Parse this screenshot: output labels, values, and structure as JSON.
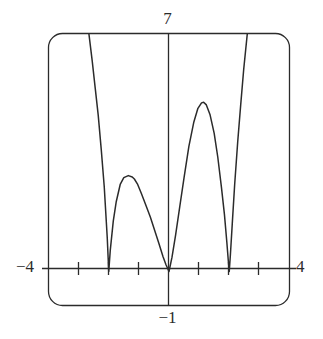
{
  "figure": {
    "kind": "graphing-calculator-window",
    "background_color": "#ffffff",
    "stroke_color": "#2b2b2b"
  },
  "labels": {
    "y_max": "7",
    "y_min": "−1",
    "x_min": "−4",
    "x_max": "4"
  },
  "chart_data": {
    "type": "line",
    "title": "",
    "xlabel": "",
    "ylabel": "",
    "xlim": [
      -4,
      4
    ],
    "ylim": [
      -1,
      7
    ],
    "grid": false,
    "legend": null,
    "x_ticks": [
      -3,
      -2,
      -1,
      0,
      1,
      2,
      3
    ],
    "x_tick_labels": [
      "",
      "",
      "",
      "",
      "",
      "",
      ""
    ],
    "y_ticks": [],
    "y_tick_labels": [],
    "axis_visible": {
      "x_axis": true,
      "y_axis": true
    },
    "x_axis_y_value": 0,
    "y_axis_x_value": 0,
    "annotations": [
      {
        "text": "7",
        "position": "above top frame, on y-axis",
        "meaning": "y window maximum"
      },
      {
        "text": "−1",
        "position": "below bottom frame, on y-axis",
        "meaning": "y window minimum"
      },
      {
        "text": "−4",
        "position": "left of frame, on x-axis",
        "meaning": "x window minimum"
      },
      {
        "text": "4",
        "position": "right of frame, on x-axis",
        "meaning": "x window maximum"
      }
    ],
    "features": {
      "zeros": [
        -2,
        0,
        2
      ],
      "zero_kind": "touches axis (cusp / V-shaped, non-negative function)",
      "local_maxima": [
        {
          "x": -1.15,
          "y": 2.82
        },
        {
          "x": 1.15,
          "y": 4.98
        }
      ],
      "off_screen_branches": [
        {
          "side": "left",
          "enters_top_at_x": -2.65
        },
        {
          "side": "right",
          "enters_top_at_x": 2.6
        }
      ],
      "description": "Non-negative curve with three cusp-like zeros at x = -2, 0, 2; two humps between them (left hump lower, right hump higher); both outer branches rise steeply off the top of the window."
    },
    "series": [
      {
        "name": "curve",
        "x": [
          -2.66,
          -2.55,
          -2.45,
          -2.35,
          -2.25,
          -2.15,
          -2.05,
          -2.0,
          -1.95,
          -1.85,
          -1.75,
          -1.62,
          -1.5,
          -1.35,
          -1.22,
          -1.15,
          -1.05,
          -0.92,
          -0.78,
          -0.62,
          -0.48,
          -0.34,
          -0.2,
          -0.1,
          0.0,
          0.1,
          0.22,
          0.36,
          0.5,
          0.66,
          0.82,
          0.96,
          1.08,
          1.15,
          1.24,
          1.36,
          1.5,
          1.62,
          1.74,
          1.84,
          1.92,
          1.97,
          2.0,
          2.04,
          2.1,
          2.18,
          2.28,
          2.38,
          2.48,
          2.6
        ],
        "y": [
          7.0,
          6.2,
          5.4,
          4.6,
          3.6,
          2.5,
          1.0,
          0.0,
          0.62,
          1.48,
          2.06,
          2.56,
          2.76,
          2.82,
          2.78,
          2.72,
          2.58,
          2.3,
          1.98,
          1.6,
          1.22,
          0.84,
          0.44,
          0.2,
          0.0,
          0.42,
          1.08,
          1.92,
          2.76,
          3.68,
          4.38,
          4.8,
          4.96,
          4.98,
          4.9,
          4.62,
          4.06,
          3.36,
          2.48,
          1.68,
          0.86,
          0.3,
          0.0,
          0.52,
          1.4,
          2.56,
          3.8,
          4.9,
          5.95,
          7.0
        ]
      }
    ]
  }
}
